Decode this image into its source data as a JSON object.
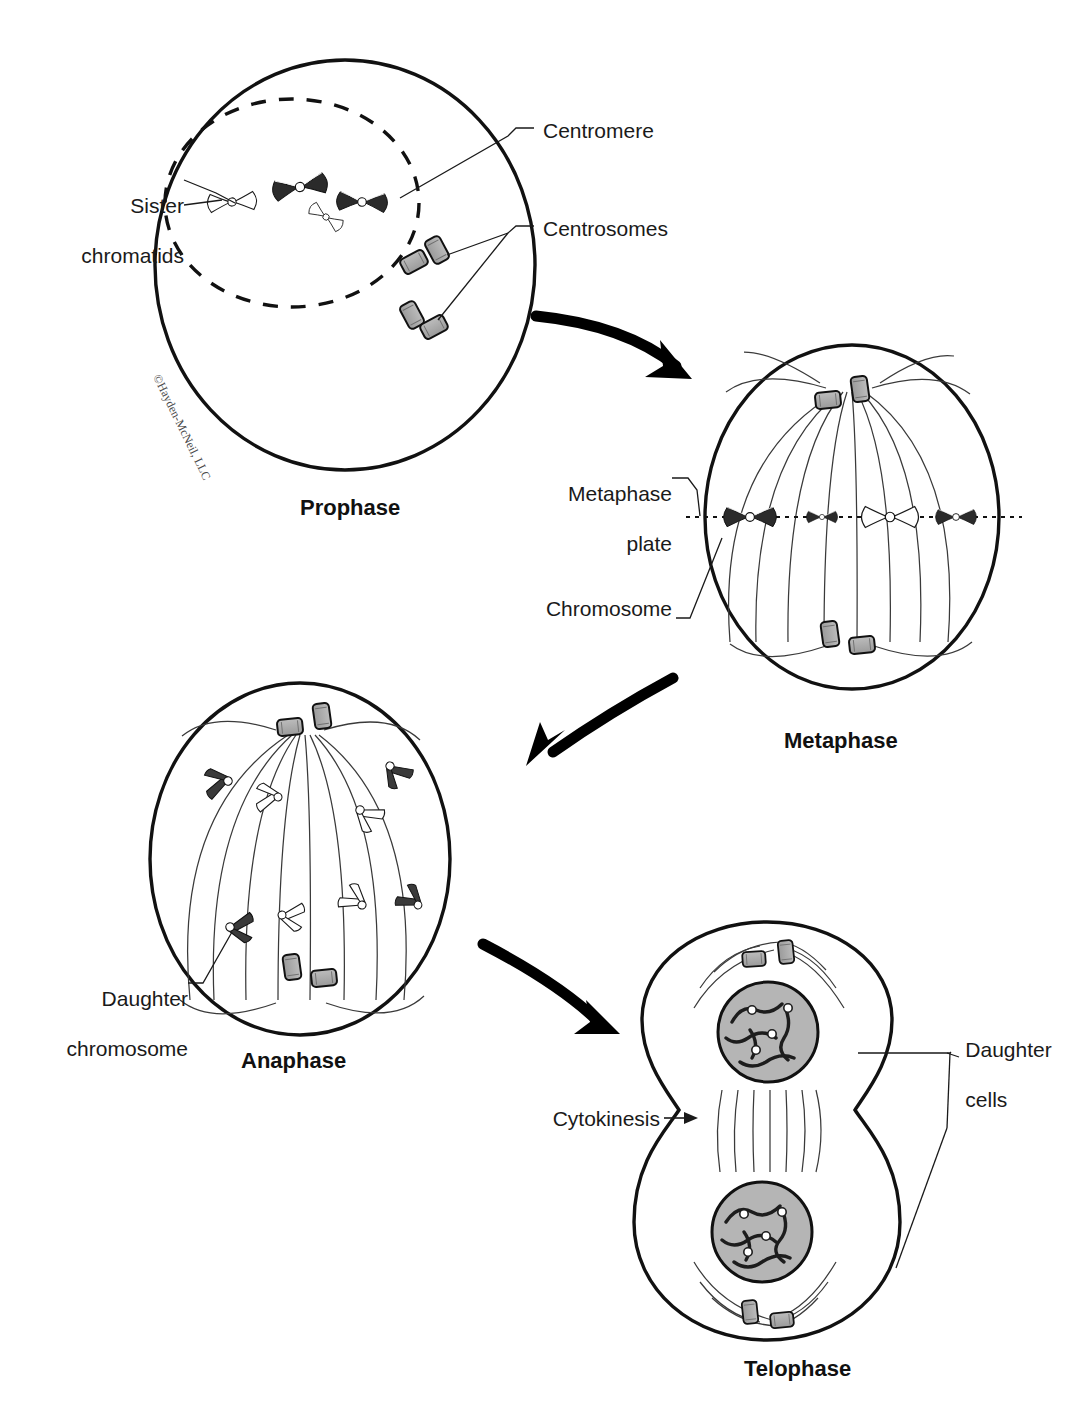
{
  "figure": {
    "copyright": "©Hayden-McNeil, LLC",
    "background_color": "#ffffff",
    "ink_color": "#1a1a1a",
    "organelle_fill": "#a8a8a8",
    "nucleus_fill": "#b5b5b5"
  },
  "phases": [
    {
      "id": "prophase",
      "label": "Prophase"
    },
    {
      "id": "metaphase",
      "label": "Metaphase"
    },
    {
      "id": "anaphase",
      "label": "Anaphase"
    },
    {
      "id": "telophase",
      "label": "Telophase"
    }
  ],
  "callouts": [
    {
      "id": "sister-chromatids",
      "text": "Sister\nchromatids",
      "phase": "prophase"
    },
    {
      "id": "centromere",
      "text": "Centromere",
      "phase": "prophase"
    },
    {
      "id": "centrosomes",
      "text": "Centrosomes",
      "phase": "prophase"
    },
    {
      "id": "metaphase-plate",
      "text": "Metaphase\nplate",
      "phase": "metaphase"
    },
    {
      "id": "chromosome",
      "text": "Chromosome",
      "phase": "metaphase"
    },
    {
      "id": "daughter-chromosome",
      "text": "Daughter\nchromosome",
      "phase": "anaphase"
    },
    {
      "id": "cytokinesis",
      "text": "Cytokinesis",
      "phase": "telophase"
    },
    {
      "id": "daughter-cells",
      "text": "Daughter\ncells",
      "phase": "telophase"
    }
  ],
  "labels": {
    "sister_chromatids_line1": "Sister",
    "sister_chromatids_line2": "chromatids",
    "centromere": "Centromere",
    "centrosomes": "Centrosomes",
    "metaphase_plate_line1": "Metaphase",
    "metaphase_plate_line2": "plate",
    "chromosome": "Chromosome",
    "daughter_chromosome_line1": "Daughter",
    "daughter_chromosome_line2": "chromosome",
    "cytokinesis": "Cytokinesis",
    "daughter_cells_line1": "Daughter",
    "daughter_cells_line2": "cells",
    "prophase": "Prophase",
    "metaphase": "Metaphase",
    "anaphase": "Anaphase",
    "telophase": "Telophase",
    "copyright": "©Hayden-McNeil, LLC"
  },
  "counts": {
    "prophase_chromosomes": 4,
    "prophase_centriole_pairs": 2,
    "metaphase_chromosomes": 4,
    "anaphase_daughter_chromosomes": 8,
    "telophase_nuclei": 2
  }
}
